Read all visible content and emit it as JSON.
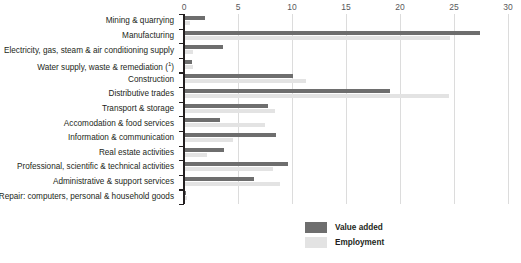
{
  "chart_data": {
    "type": "bar",
    "orientation": "horizontal",
    "title": "",
    "subtitle": "",
    "xlabel": "",
    "ylabel": "",
    "xlim": [
      0,
      30
    ],
    "ticks": [
      "0",
      "5",
      "10",
      "15",
      "20",
      "25",
      "30"
    ],
    "tick_values": [
      0,
      5,
      10,
      15,
      20,
      25,
      30
    ],
    "grid": true,
    "legend_position": "bottom-right",
    "categories": [
      "Mining & quarrying",
      "Manufacturing",
      "Electricity, gas, steam & air conditioning supply",
      "Water supply, waste & remediation (¹)",
      "Construction",
      "Distributive trades",
      "Transport & storage",
      "Accomodation & food services",
      "Information & communication",
      "Real estate activities",
      "Professional, scientific & technical activities",
      "Administrative & support services",
      "Repair: computers, personal & household goods"
    ],
    "series": [
      {
        "name": "Value added",
        "color": "#6e6e6e",
        "values": [
          1.9,
          27.4,
          3.6,
          0.7,
          10.1,
          19.1,
          7.8,
          3.3,
          8.5,
          3.7,
          9.6,
          6.5,
          0.2
        ]
      },
      {
        "name": "Employment",
        "color": "#e3e3e3",
        "values": [
          0.6,
          24.6,
          0.8,
          0.8,
          11.3,
          24.5,
          8.4,
          7.5,
          4.5,
          2.1,
          8.2,
          8.9,
          0.3
        ]
      }
    ]
  },
  "legend": {
    "items": [
      {
        "label": "Value added",
        "color": "#6e6e6e"
      },
      {
        "label": "Employment",
        "color": "#e3e3e3"
      }
    ]
  }
}
